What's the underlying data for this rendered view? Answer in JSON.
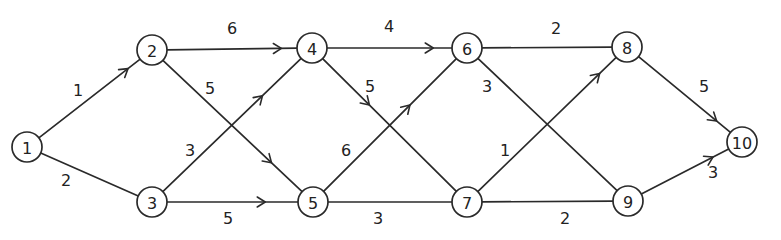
{
  "diagram": {
    "type": "directed-weighted-network",
    "nodes": [
      {
        "id": "1",
        "label": "1",
        "x": 27,
        "y": 147
      },
      {
        "id": "2",
        "label": "2",
        "x": 152,
        "y": 50
      },
      {
        "id": "3",
        "label": "3",
        "x": 152,
        "y": 202
      },
      {
        "id": "4",
        "label": "4",
        "x": 312,
        "y": 48
      },
      {
        "id": "5",
        "label": "5",
        "x": 313,
        "y": 202
      },
      {
        "id": "6",
        "label": "6",
        "x": 467,
        "y": 48
      },
      {
        "id": "7",
        "label": "7",
        "x": 467,
        "y": 202
      },
      {
        "id": "8",
        "label": "8",
        "x": 627,
        "y": 47
      },
      {
        "id": "9",
        "label": "9",
        "x": 628,
        "y": 201
      },
      {
        "id": "10",
        "label": "10",
        "x": 742,
        "y": 142
      }
    ],
    "edges": [
      {
        "from": "1",
        "to": "2",
        "weight": "1",
        "label_x": 78,
        "label_y": 90,
        "arrow_t": 0.88
      },
      {
        "from": "1",
        "to": "3",
        "weight": "2",
        "label_x": 66,
        "label_y": 180,
        "arrow_t": null
      },
      {
        "from": "2",
        "to": "4",
        "weight": "6",
        "label_x": 232,
        "label_y": 28,
        "arrow_t": 0.88
      },
      {
        "from": "2",
        "to": "5",
        "weight": "5",
        "label_x": 210,
        "label_y": 88,
        "arrow_t": 0.78
      },
      {
        "from": "3",
        "to": "4",
        "weight": "3",
        "label_x": 190,
        "label_y": 150,
        "arrow_t": 0.72
      },
      {
        "from": "3",
        "to": "5",
        "weight": "5",
        "label_x": 228,
        "label_y": 218,
        "arrow_t": 0.75
      },
      {
        "from": "4",
        "to": "6",
        "weight": "4",
        "label_x": 389,
        "label_y": 26,
        "arrow_t": 0.85
      },
      {
        "from": "4",
        "to": "7",
        "weight": "5",
        "label_x": 370,
        "label_y": 86,
        "arrow_t": 0.35
      },
      {
        "from": "5",
        "to": "6",
        "weight": "6",
        "label_x": 346,
        "label_y": 150,
        "arrow_t": 0.65
      },
      {
        "from": "5",
        "to": "7",
        "weight": "3",
        "label_x": 378,
        "label_y": 218,
        "arrow_t": null
      },
      {
        "from": "6",
        "to": "8",
        "weight": "2",
        "label_x": 556,
        "label_y": 28,
        "arrow_t": null
      },
      {
        "from": "6",
        "to": "9",
        "weight": "3",
        "label_x": 487,
        "label_y": 86,
        "arrow_t": null
      },
      {
        "from": "7",
        "to": "8",
        "weight": "1",
        "label_x": 505,
        "label_y": 150,
        "arrow_t": 0.88
      },
      {
        "from": "7",
        "to": "9",
        "weight": "2",
        "label_x": 565,
        "label_y": 218,
        "arrow_t": null
      },
      {
        "from": "8",
        "to": "10",
        "weight": "5",
        "label_x": 704,
        "label_y": 86,
        "arrow_t": 0.85
      },
      {
        "from": "9",
        "to": "10",
        "weight": "3",
        "label_x": 713,
        "label_y": 172,
        "arrow_t": 0.82
      }
    ]
  },
  "style": {
    "stroke_color": "#2a2a2a",
    "background": "#ffffff",
    "node_radius": 15
  }
}
